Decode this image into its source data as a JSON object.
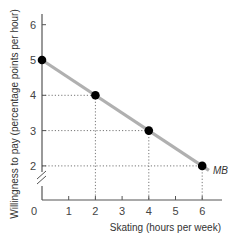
{
  "chart_data": {
    "type": "line",
    "title": "",
    "xlabel": "Skating (hours per week)",
    "ylabel": "Willingness to pay (percentage points per hour)",
    "x_ticks": [
      "0",
      "1",
      "2",
      "3",
      "4",
      "5",
      "6"
    ],
    "y_ticks": [
      "2",
      "3",
      "4",
      "5",
      "6"
    ],
    "xlim": [
      0,
      6.6
    ],
    "ylim": [
      1,
      6.3
    ],
    "y_axis_break": true,
    "grid": false,
    "series": [
      {
        "name": "MB",
        "x": [
          0,
          2,
          4,
          6
        ],
        "y": [
          5,
          4,
          3,
          2
        ],
        "line_color": "#b0b0b0",
        "marker_color": "#000000"
      }
    ],
    "annotations": [
      {
        "text": "MB",
        "x": 6,
        "y": 2,
        "position": "right"
      }
    ],
    "guide_lines": "dotted lines from each point to both axes"
  },
  "labels": {
    "x_axis": "Skating (hours per week)",
    "y_axis": "Willingness to pay (percentage points per hour)",
    "curve": "MB",
    "origin": "0"
  }
}
